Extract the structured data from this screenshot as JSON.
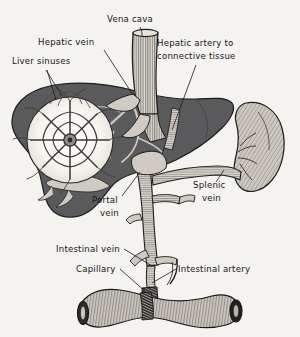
{
  "figure": {
    "background_color": "#f5f3ef",
    "ink_color": "#161616",
    "liver_color": "#5a5a5c",
    "vessel_color": "#d8d4cb",
    "labels": [
      {
        "id": "vena-cava",
        "text": "Vena cava",
        "x": 107,
        "y": 22
      },
      {
        "id": "hepatic-vein",
        "text": "Hepatic vein",
        "x": 38,
        "y": 45
      },
      {
        "id": "liver-sinuses",
        "text": "Liver sinuses",
        "x": 12,
        "y": 64
      },
      {
        "id": "hepatic-artery-1",
        "text": "Hepatic artery to",
        "x": 157,
        "y": 46
      },
      {
        "id": "hepatic-artery-2",
        "text": "connective tissue",
        "x": 157,
        "y": 59
      },
      {
        "id": "portal-vein-1",
        "text": "Portal",
        "x": 92,
        "y": 203
      },
      {
        "id": "portal-vein-2",
        "text": "vein",
        "x": 100,
        "y": 216
      },
      {
        "id": "splenic-vein-1",
        "text": "Splenic",
        "x": 193,
        "y": 188
      },
      {
        "id": "splenic-vein-2",
        "text": "vein",
        "x": 202,
        "y": 201
      },
      {
        "id": "intestinal-vein",
        "text": "Intestinal vein",
        "x": 56,
        "y": 252
      },
      {
        "id": "capillary",
        "text": "Capillary",
        "x": 76,
        "y": 272
      },
      {
        "id": "intestinal-artery",
        "text": "Intestinal artery",
        "x": 178,
        "y": 272
      }
    ],
    "structures": [
      {
        "id": "liver",
        "name": "Liver"
      },
      {
        "id": "vena-cava",
        "name": "Vena cava"
      },
      {
        "id": "spleen",
        "name": "Spleen"
      },
      {
        "id": "intestine",
        "name": "Intestine"
      },
      {
        "id": "sinusoid-inset",
        "name": "Liver sinuses magnified inset"
      },
      {
        "id": "portal-vein",
        "name": "Portal vein"
      },
      {
        "id": "splenic-vein",
        "name": "Splenic vein"
      },
      {
        "id": "capillary-bed",
        "name": "Capillary bed"
      }
    ]
  }
}
